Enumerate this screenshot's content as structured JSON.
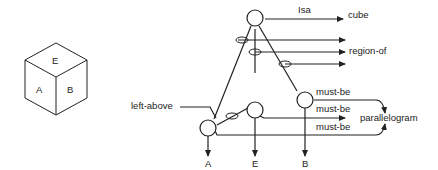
{
  "cube": {
    "faces": {
      "top": "E",
      "left": "A",
      "right": "B"
    }
  },
  "network": {
    "relations": {
      "isa": "Isa",
      "left_above": "left-above",
      "must_be_1": "must-be",
      "must_be_2": "must-be",
      "must_be_3": "must-be"
    },
    "targets": {
      "cube": "cube",
      "region_of": "region-of",
      "parallelogram": "parallelogram"
    },
    "leaves": {
      "a": "A",
      "e": "E",
      "b": "B"
    }
  }
}
